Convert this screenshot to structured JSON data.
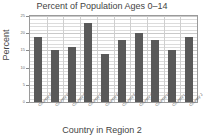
{
  "chart_data": {
    "type": "bar",
    "title": "Percent of Population Ages 0–14",
    "xlabel": "Country in Region 2",
    "ylabel": "Percent",
    "categories": [
      "Country A",
      "Country B",
      "Country C",
      "Country D",
      "Country E",
      "Country F",
      "Country G",
      "Country H",
      "Country I",
      "Country J"
    ],
    "values": [
      19,
      15,
      16,
      23,
      14,
      18,
      20,
      18,
      15,
      19
    ],
    "ylim": [
      0,
      25
    ],
    "yticks": [
      0,
      5,
      10,
      15,
      20,
      25
    ],
    "ytick_labels": [
      "0",
      "5",
      "10",
      "15",
      "20",
      "25"
    ],
    "grid": true,
    "legend": false,
    "bar_color": "#595959",
    "grid_color": "#c9c9c9",
    "axis_color": "#9a9a9a"
  }
}
